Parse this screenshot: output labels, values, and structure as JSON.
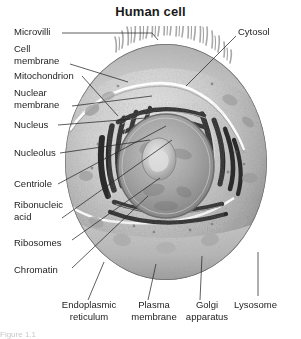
{
  "figure": {
    "title": "Human cell",
    "bottom_caption_fragment": "Figure 1.1"
  },
  "labels_left": [
    {
      "id": "microvilli",
      "lines": [
        "Microvilli"
      ]
    },
    {
      "id": "cell-membrane",
      "lines": [
        "Cell",
        "membrane"
      ]
    },
    {
      "id": "mitochondrion",
      "lines": [
        "Mitochondrion"
      ]
    },
    {
      "id": "nuclear-membrane",
      "lines": [
        "Nuclear",
        "membrane"
      ]
    },
    {
      "id": "nucleus",
      "lines": [
        "Nucleus"
      ]
    },
    {
      "id": "nucleolus",
      "lines": [
        "Nucleolus"
      ]
    },
    {
      "id": "centriole",
      "lines": [
        "Centriole"
      ]
    },
    {
      "id": "ribonucleic-acid",
      "lines": [
        "Ribonucleic",
        "acid"
      ]
    },
    {
      "id": "ribosomes",
      "lines": [
        "Ribosomes"
      ]
    },
    {
      "id": "chromatin",
      "lines": [
        "Chromatin"
      ]
    }
  ],
  "labels_right": [
    {
      "id": "cytosol",
      "lines": [
        "Cytosol"
      ]
    },
    {
      "id": "lysosome",
      "lines": [
        "Lysosome"
      ]
    }
  ],
  "labels_bottom": [
    {
      "id": "endoplasmic-reticulum",
      "lines": [
        "Endoplasmic",
        "reticulum"
      ]
    },
    {
      "id": "plasma-membrane",
      "lines": [
        "Plasma",
        "membrane"
      ]
    },
    {
      "id": "golgi-apparatus",
      "lines": [
        "Golgi",
        "apparatus"
      ]
    }
  ],
  "colors": {
    "title": "#1a1a1a",
    "label_text": "#1d1d1d",
    "leader_line": "#2a2a2a",
    "background": "#ffffff",
    "cytoplasm_light": "#d9d9d9",
    "cytoplasm_mid": "#b6b6b6",
    "cytoplasm_dark": "#8f8f8f",
    "organelle_dark": "#2b2b2b",
    "nucleus_fill": "#a9a9a9",
    "nucleolus_fill": "#cfcfcf",
    "membrane_highlight": "#ffffff"
  },
  "artwork": {
    "style": "grayscale-shaded-biological-illustration",
    "description": "Cutaway human cell sphere with microvilli on the upper surface, a white membrane highlight arc across the cytoplasm, concentric dark endoplasmic-reticulum bands around a large central nucleus containing a nucleolus, and scattered vesicles."
  }
}
